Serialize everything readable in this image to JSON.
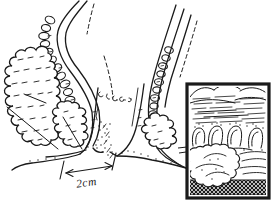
{
  "figure": {
    "alt": "Hand-drawn sagittal cross-section of the anal canal with sphincter muscles, a 2cm scale measurement at the anal verge, and a framed magnified inset of the tissue at lower right",
    "scale_label": "2cm",
    "colors": {
      "ink": "#1a1a1a",
      "paper": "#ffffff",
      "inset_hatch_bg": "#b9b9b9"
    }
  }
}
